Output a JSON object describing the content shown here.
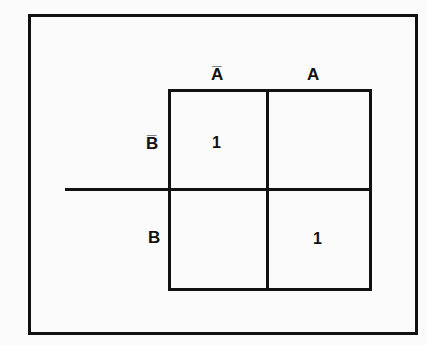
{
  "diagram": {
    "type": "karnaugh-map",
    "column_labels": [
      "A̅",
      "A"
    ],
    "row_labels": [
      "B̅",
      "B"
    ],
    "cells": [
      [
        "1",
        ""
      ],
      [
        "",
        "1"
      ]
    ]
  }
}
